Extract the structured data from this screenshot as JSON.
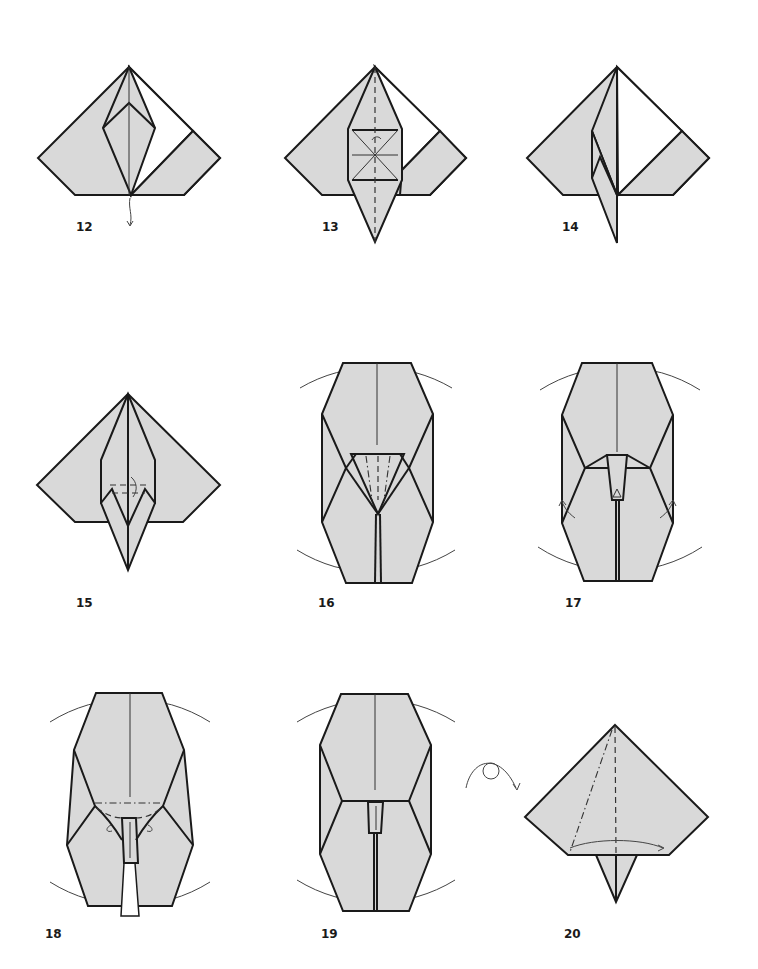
{
  "colors": {
    "paper": "#d9d9d9",
    "line": "#1a1a1a",
    "background": "#ffffff"
  },
  "steps": [
    {
      "number": "12",
      "description": "diamond flap with arrow pulling point down"
    },
    {
      "number": "13",
      "description": "valley fold down center, squash marks"
    },
    {
      "number": "14",
      "description": "flap folded across"
    },
    {
      "number": "15",
      "description": "small valley/mountain fold with rotation arrow"
    },
    {
      "number": "16",
      "description": "enlarged view, triangle pleats"
    },
    {
      "number": "17",
      "description": "enlarged view, side arrows outward"
    },
    {
      "number": "18",
      "description": "enlarged view, mountain-dash fold line"
    },
    {
      "number": "19",
      "description": "enlarged view, result"
    },
    {
      "number": "20",
      "description": "turn over, fold edge across"
    }
  ],
  "symbols": {
    "turn_over": "turn-over-icon"
  }
}
